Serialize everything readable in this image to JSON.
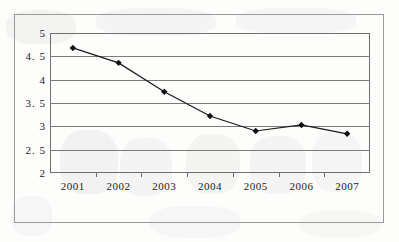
{
  "chart_data": {
    "type": "line",
    "title": "",
    "subtitle": "",
    "xlabel": "",
    "ylabel": "",
    "categories": [
      "2001",
      "2002",
      "2003",
      "2004",
      "2005",
      "2006",
      "2007"
    ],
    "series": [
      {
        "name": "series-1",
        "values": [
          4.68,
          4.36,
          3.74,
          3.22,
          2.9,
          3.03,
          2.84
        ]
      }
    ],
    "ylim": [
      2,
      5
    ],
    "ytick_labels": [
      "5",
      "4. 5",
      "4",
      "3. 5",
      "3",
      "2. 5",
      "2"
    ],
    "ytick_values": [
      5,
      4.5,
      4,
      3.5,
      3,
      2.5,
      2
    ],
    "grid": true,
    "legend": false,
    "legend_position": "none",
    "marker": "diamond",
    "line_color": "#1a1a1a",
    "marker_color": "#111111",
    "grid_color": "#7b7b7b",
    "plot_border_color": "#6f6f6f",
    "frame_border_color": "#9a9a9a",
    "background_color": "#fdfdfc"
  }
}
